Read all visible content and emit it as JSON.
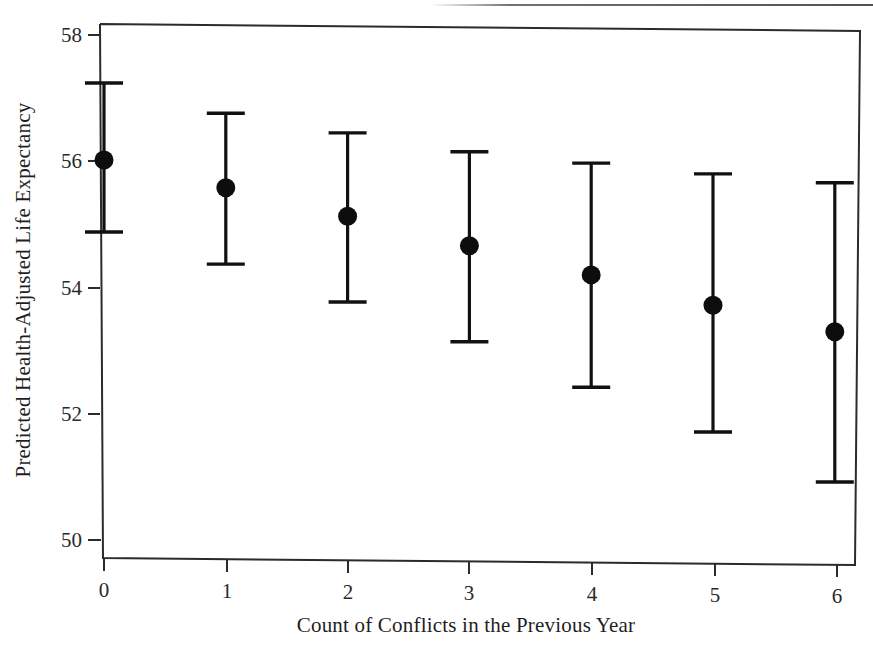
{
  "chart_data": {
    "type": "scatter",
    "title": "",
    "subtitle": "",
    "xlabel": "Count of Conflicts in the Previous Year",
    "ylabel": "Predicted Health-Adjusted Life Expectancy",
    "x": [
      0,
      1,
      2,
      3,
      4,
      5,
      6
    ],
    "xtick_labels": [
      "0",
      "1",
      "2",
      "3",
      "4",
      "5",
      "6"
    ],
    "ytick_labels": [
      "50",
      "52",
      "54",
      "56",
      "58"
    ],
    "yticks": [
      50,
      52,
      54,
      56,
      58
    ],
    "xlim": [
      -0.35,
      6.15
    ],
    "ylim": [
      49.6,
      58.4
    ],
    "grid": false,
    "legend": "none",
    "marker": "filled-circle",
    "errorbar_style": "capped-vertical",
    "series": [
      {
        "name": "Predicted Health-Adjusted Life Expectancy",
        "values": [
          56.02,
          55.58,
          55.13,
          54.66,
          54.2,
          53.72,
          53.3
        ],
        "ci_lower": [
          54.88,
          54.37,
          53.77,
          53.14,
          52.42,
          51.71,
          50.92
        ],
        "ci_upper": [
          57.24,
          56.76,
          56.45,
          56.15,
          55.97,
          55.8,
          55.66
        ]
      }
    ],
    "points": [
      {
        "x": 0,
        "y": 56.02,
        "lo": 54.88,
        "hi": 57.24
      },
      {
        "x": 1,
        "y": 55.58,
        "lo": 54.37,
        "hi": 56.76
      },
      {
        "x": 2,
        "y": 55.13,
        "lo": 53.77,
        "hi": 56.45
      },
      {
        "x": 3,
        "y": 54.66,
        "lo": 53.14,
        "hi": 56.15
      },
      {
        "x": 4,
        "y": 54.2,
        "lo": 52.42,
        "hi": 55.97
      },
      {
        "x": 5,
        "y": 53.72,
        "lo": 51.71,
        "hi": 55.8
      },
      {
        "x": 6,
        "y": 53.3,
        "lo": 50.92,
        "hi": 55.66
      }
    ],
    "colors": {
      "marker": "#0d0d0d",
      "errorbar": "#111111",
      "axis": "#2b2b2b",
      "text": "#1f1f1f",
      "background": "#ffffff"
    }
  }
}
